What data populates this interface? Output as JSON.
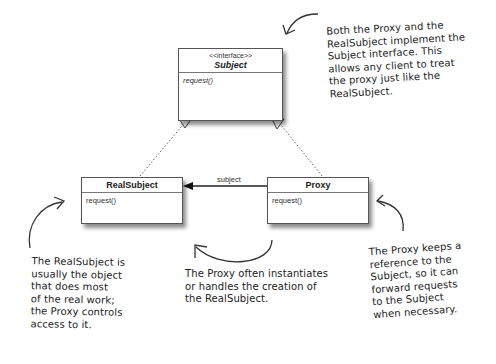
{
  "diagram": {
    "classes": [
      {
        "id": "subject",
        "stereotype": "<<interface>>",
        "name": "Subject",
        "operations": [
          "request()"
        ],
        "italic": true
      },
      {
        "id": "realsubject",
        "stereotype": "",
        "name": "RealSubject",
        "operations": [
          "request()"
        ],
        "italic": false
      },
      {
        "id": "proxy",
        "stereotype": "",
        "name": "Proxy",
        "operations": [
          "request()"
        ],
        "italic": false
      }
    ],
    "relationships": [
      {
        "from": "RealSubject",
        "to": "Subject",
        "type": "realization"
      },
      {
        "from": "Proxy",
        "to": "Subject",
        "type": "realization"
      },
      {
        "from": "Proxy",
        "to": "RealSubject",
        "type": "association",
        "label": "subject"
      }
    ],
    "annotations": {
      "subject_note": "Both the Proxy and the\nRealSubject implement the\nSubject interface.  This\nallows any client to treat\nthe proxy just like the\nRealSubject.",
      "realsubject_note": "The RealSubject is\nusually the object\nthat does most\nof the real work;\nthe Proxy controls\naccess to it.",
      "creation_note": "The Proxy often instantiates\nor handles the creation of\nthe RealSubject.",
      "proxy_note": "The Proxy keeps a\nreference to the\nSubject, so it can\nforward requests\nto the Subject\nwhen necessary."
    }
  }
}
